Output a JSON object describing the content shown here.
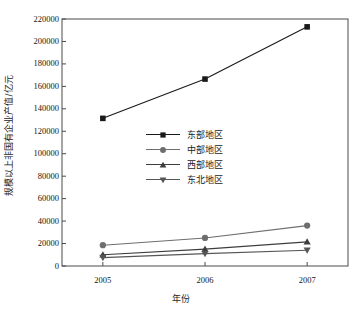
{
  "chart_data": {
    "type": "line",
    "title": "",
    "xlabel": "年份",
    "ylabel": "规模以上非国有企业产值/亿元",
    "categories": [
      "2005",
      "2006",
      "2007"
    ],
    "x": [
      2005,
      2006,
      2007
    ],
    "xlim": [
      2004.6,
      2007.4
    ],
    "ylim": [
      0,
      220000
    ],
    "ytick_labels": [
      "0",
      "20000",
      "40000",
      "60000",
      "80000",
      "100000",
      "120000",
      "140000",
      "160000",
      "180000",
      "200000",
      "220000"
    ],
    "ytick_values": [
      0,
      20000,
      40000,
      60000,
      80000,
      100000,
      120000,
      140000,
      160000,
      180000,
      200000,
      220000
    ],
    "grid": false,
    "legend_position": "upper-center-inside",
    "series": [
      {
        "name": "东部地区",
        "marker": "square",
        "color": "#1a1a1a",
        "values": [
          131500,
          166500,
          213000
        ]
      },
      {
        "name": "中部地区",
        "marker": "circle",
        "color": "#6e6e6e",
        "values": [
          18500,
          25000,
          36000
        ]
      },
      {
        "name": "西部地区",
        "marker": "triangle-up",
        "color": "#3d3d3d",
        "values": [
          10000,
          15000,
          21500
        ]
      },
      {
        "name": "东北地区",
        "marker": "triangle-down",
        "color": "#555555",
        "values": [
          7500,
          11000,
          14000
        ]
      }
    ]
  },
  "axes": {
    "frame_color": "#4a4a4a",
    "tick_color": "#4a4a4a"
  }
}
